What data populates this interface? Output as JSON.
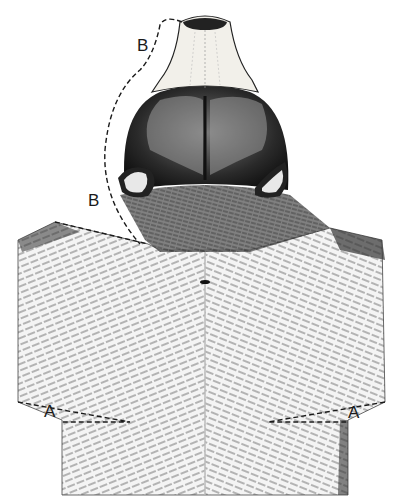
{
  "figure": {
    "type": "pen-and-ink illustration",
    "background_color": "#ffffff",
    "ink_color": "#1a1a1a",
    "snout_color": "#f2f0ea"
  },
  "labels": {
    "b_upper": "B",
    "b_lower": "B",
    "a_left": "A",
    "a_right": "A"
  },
  "dashed_lines": [
    {
      "id": "B-outline",
      "description": "dashed curve from snout tip down the left side of the head to the neck"
    },
    {
      "id": "B-shoulder",
      "description": "dashed line from left shoulder corner to the neck"
    },
    {
      "id": "A-left",
      "description": "dashed notch at lower left of back"
    },
    {
      "id": "A-right",
      "description": "dashed notch at lower right of back"
    }
  ]
}
